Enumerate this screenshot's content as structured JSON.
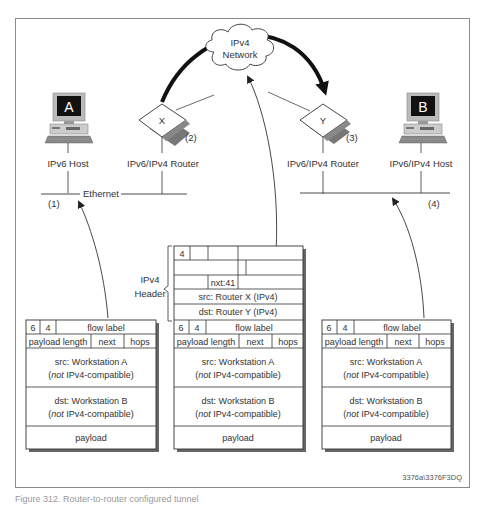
{
  "hosts": {
    "a": {
      "letter": "A",
      "label": "IPv6 Host",
      "step": "(1)"
    },
    "b": {
      "letter": "B",
      "label": "IPv6/IPv4 Host",
      "step": "(4)"
    }
  },
  "routers": {
    "x": {
      "letter": "X",
      "label": "IPv6/IPv4 Router",
      "step": "(2)"
    },
    "y": {
      "letter": "Y",
      "label": "IPv6/IPv4 Router",
      "step": "(3)"
    }
  },
  "cloud": {
    "line1": "IPv4",
    "line2": "Network"
  },
  "lan_left": {
    "label": "Ethernet"
  },
  "ipv4_header": {
    "label_line1": "IPv4",
    "label_line2": "Header",
    "version": "4",
    "next": "nxt:41",
    "src": "src: Router X (IPv4)",
    "dst": "dst: Router Y (IPv4)"
  },
  "ipv6_packet": {
    "version": "6",
    "traffic": "4",
    "flow_label": "flow label",
    "payload_length": "payload length",
    "next": "next",
    "hops": "hops",
    "src_line1": "src: Workstation A",
    "dst_line1": "dst: Workstation B",
    "compat_not": "not",
    "compat_rest": " IPv4-compatible)",
    "compat_open": "(",
    "payload": "payload"
  },
  "figure_id": "3376a\\3376F3DQ",
  "caption": "Figure 312. Router-to-router configured tunnel"
}
